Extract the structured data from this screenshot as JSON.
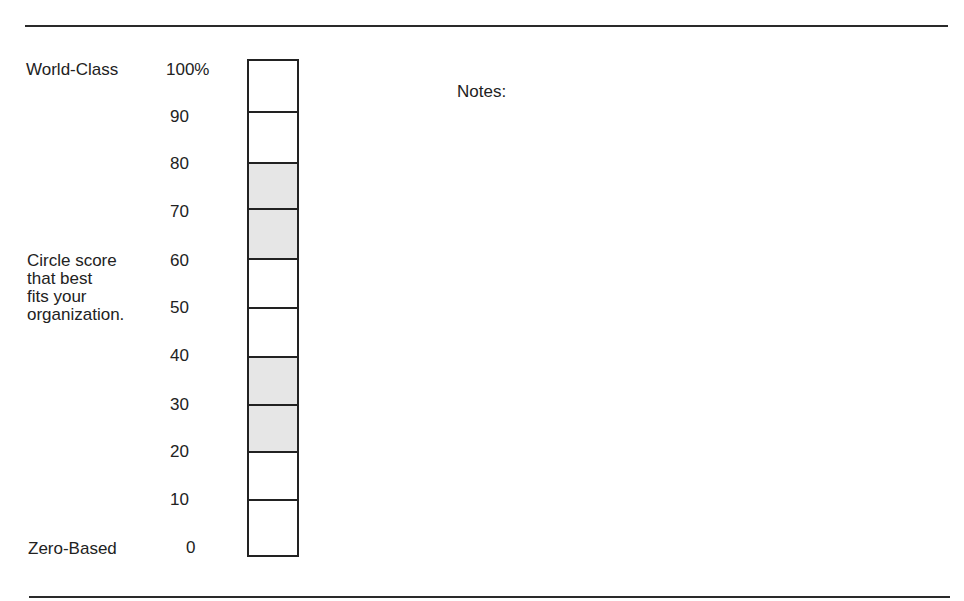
{
  "labels": {
    "top": "World-Class",
    "middle": [
      "Circle score",
      "that best",
      "fits your",
      "organization."
    ],
    "bottom": "Zero-Based"
  },
  "notes_label": "Notes:",
  "scale": {
    "ticks": [
      "100%",
      "90",
      "80",
      "70",
      "60",
      "50",
      "40",
      "30",
      "20",
      "10",
      "0"
    ],
    "cells": [
      {
        "range": "90-100",
        "shaded": false
      },
      {
        "range": "80-90",
        "shaded": false
      },
      {
        "range": "70-80",
        "shaded": true
      },
      {
        "range": "60-70",
        "shaded": true
      },
      {
        "range": "50-60",
        "shaded": false
      },
      {
        "range": "40-50",
        "shaded": false
      },
      {
        "range": "30-40",
        "shaded": true
      },
      {
        "range": "20-30",
        "shaded": true
      },
      {
        "range": "10-20",
        "shaded": false
      },
      {
        "range": "0-10",
        "shaded": false
      }
    ],
    "shade_color": "#e6e6e6",
    "border_color": "#222222"
  }
}
